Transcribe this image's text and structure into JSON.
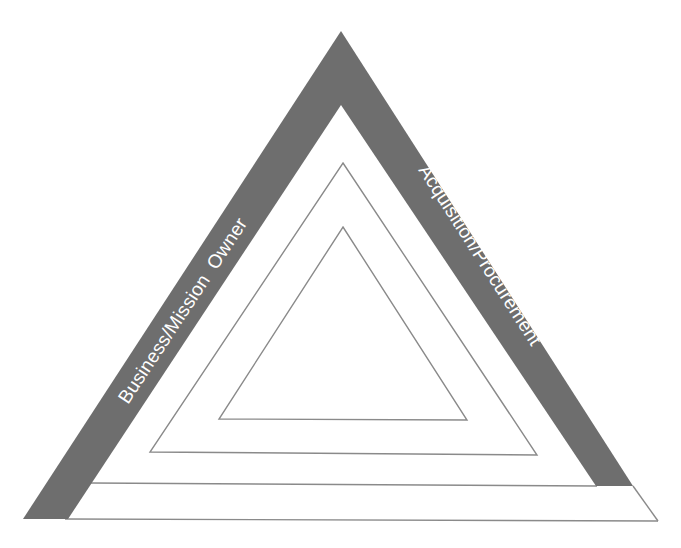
{
  "diagram": {
    "type": "nested-triangle",
    "colors": {
      "band": "#6e6e6e",
      "outline": "#8a8a8a",
      "background": "#ffffff",
      "label_text": "#ffffff"
    },
    "sides": {
      "left": {
        "label": "Business/Mission  Owner"
      },
      "right": {
        "label": "Acquisition/Procurement"
      },
      "bottom": {
        "label": ""
      }
    },
    "nested_triangles": [
      {
        "level": "middle",
        "label": ""
      },
      {
        "level": "inner",
        "label": ""
      }
    ]
  }
}
